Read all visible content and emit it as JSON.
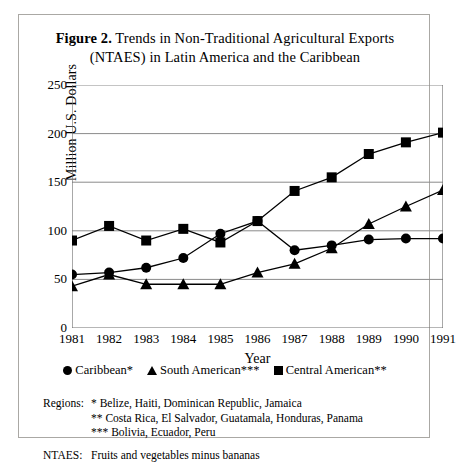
{
  "figure": {
    "label": "Figure 2.",
    "title_line1": " Trends in Non-Traditional Agricultural Exports",
    "title_line2": "(NTAES) in Latin America and the Caribbean"
  },
  "chart_data": {
    "type": "line",
    "title": "Figure 2. Trends in Non-Traditional Agricultural Exports (NTAES) in Latin America and the Caribbean",
    "xlabel": "Year",
    "ylabel": "Million U.S. Dollars",
    "x": [
      1981,
      1982,
      1983,
      1984,
      1985,
      1986,
      1987,
      1988,
      1989,
      1990,
      1991
    ],
    "xtick_labels": [
      "1981",
      "1982",
      "1983",
      "1984",
      "1985",
      "1986",
      "1987",
      "1988",
      "1989",
      "1990",
      "1991"
    ],
    "ytick_labels": [
      "0",
      "50",
      "100",
      "150",
      "200",
      "250"
    ],
    "yticks": [
      0,
      50,
      100,
      150,
      200,
      250
    ],
    "ylim": [
      0,
      250
    ],
    "xlim": [
      1981,
      1991
    ],
    "grid": "horizontal",
    "legend_position": "below-axes",
    "series": [
      {
        "name": "Caribbean*",
        "marker": "circle",
        "values": [
          55,
          57,
          62,
          72,
          97,
          110,
          80,
          85,
          91,
          92,
          92
        ]
      },
      {
        "name": "South American***",
        "marker": "triangle",
        "values": [
          43,
          55,
          45,
          45,
          45,
          57,
          66,
          82,
          107,
          125,
          142
        ]
      },
      {
        "name": "Central American**",
        "marker": "square",
        "values": [
          90,
          105,
          90,
          102,
          88,
          110,
          141,
          155,
          179,
          191,
          201
        ]
      }
    ]
  },
  "legend": {
    "items": [
      {
        "label": "Caribbean*",
        "marker": "circle"
      },
      {
        "label": "South American***",
        "marker": "triangle"
      },
      {
        "label": "Central American**",
        "marker": "square"
      }
    ]
  },
  "notes": {
    "regions_key": "Regions:",
    "regions_line1": "*  Belize, Haiti, Dominican Republic, Jamaica",
    "regions_line2": "**  Costa Rica, El Salvador, Guatamala, Honduras, Panama",
    "regions_line3": "***  Bolivia, Ecuador, Peru",
    "ntaes_key": "NTAES:",
    "ntaes_value": "Fruits and vegetables minus bananas"
  }
}
